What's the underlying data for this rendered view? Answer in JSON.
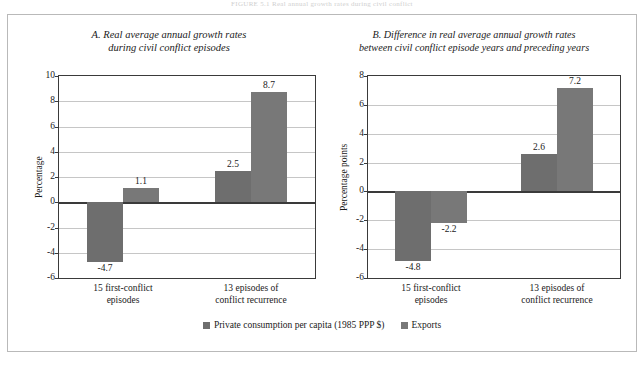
{
  "masthead": "FIGURE 5.1  Real annual growth rates during civil conflict",
  "legend": {
    "position": "bottom-center",
    "items": [
      {
        "label": "Private consumption per capita (1985 PPP $)",
        "color": "#6e6e6e",
        "swatch": "square-swatch-icon"
      },
      {
        "label": "Exports",
        "color": "#787878",
        "swatch": "square-swatch-icon"
      }
    ]
  },
  "chart_data": [
    {
      "type": "bar",
      "panel": "A",
      "title": "A. Real average annual growth rates during civil conflict episodes",
      "title_line1": "A. Real average annual growth rates",
      "title_line2": "during civil conflict episodes",
      "xlabel": "",
      "ylabel": "Percentage",
      "ylim": [
        -6,
        10
      ],
      "yticks": [
        10,
        8,
        6,
        4,
        2,
        0,
        -2,
        -4,
        -6
      ],
      "ytick_labels": [
        "10",
        "8",
        "6",
        "4",
        "2",
        "0",
        "-2",
        "-4",
        "-6"
      ],
      "grid": true,
      "categories": [
        "15 first-conflict episodes",
        "13 episodes of conflict recurrence"
      ],
      "category_lines": [
        [
          "15 first-conflict",
          "episodes"
        ],
        [
          "13 episodes of",
          "conflict recurrence"
        ]
      ],
      "series": [
        {
          "name": "Private consumption per capita (1985 PPP $)",
          "color": "#6e6e6e",
          "values": [
            -4.7,
            2.5
          ],
          "labels": [
            "-4.7",
            "2.5"
          ]
        },
        {
          "name": "Exports",
          "color": "#787878",
          "values": [
            1.1,
            8.7
          ],
          "labels": [
            "1.1",
            "8.7"
          ]
        }
      ]
    },
    {
      "type": "bar",
      "panel": "B",
      "title": "B. Difference in real average annual growth rates between civil conflict episode years and preceding years",
      "title_line1": "B. Difference in real average annual growth rates",
      "title_line2": "between civil conflict episode years and preceding years",
      "xlabel": "",
      "ylabel": "Percentage points",
      "ylim": [
        -6,
        8
      ],
      "yticks": [
        8,
        6,
        4,
        2,
        0,
        -2,
        -4,
        -6
      ],
      "ytick_labels": [
        "8",
        "6",
        "4",
        "2",
        "0",
        "-2",
        "-4",
        "-6"
      ],
      "grid": true,
      "categories": [
        "15 first-conflict episodes",
        "13 episodes of conflict recurrence"
      ],
      "category_lines": [
        [
          "15 first-conflict",
          "episodes"
        ],
        [
          "13 episodes of",
          "conflict recurrence"
        ]
      ],
      "series": [
        {
          "name": "Private consumption per capita (1985 PPP $)",
          "color": "#6e6e6e",
          "values": [
            -4.8,
            2.6
          ],
          "labels": [
            "-4.8",
            "2.6"
          ]
        },
        {
          "name": "Exports",
          "color": "#787878",
          "values": [
            -2.2,
            7.2
          ],
          "labels": [
            "-2.2",
            "7.2"
          ]
        }
      ]
    }
  ]
}
